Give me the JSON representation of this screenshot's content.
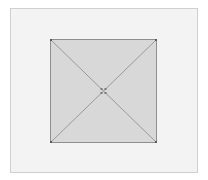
{
  "diagram": {
    "type": "square-with-diagonals",
    "frame": {
      "x": 10,
      "y": 8,
      "width": 188,
      "height": 165,
      "fill": "#f3f3f3",
      "stroke": "#cfcfcf"
    },
    "square": {
      "x": 50,
      "y": 39,
      "width": 107,
      "height": 104,
      "fill": "#d8d8d8",
      "stroke": "#8f8f8f"
    },
    "diagonals": {
      "stroke": "#9a9a9a"
    },
    "center_marker": {
      "x": 103.5,
      "y": 91,
      "color": "#7a7a7a",
      "shape": "four-dot-crosshair"
    },
    "corner_markers": {
      "color": "#5a5a5a"
    }
  }
}
